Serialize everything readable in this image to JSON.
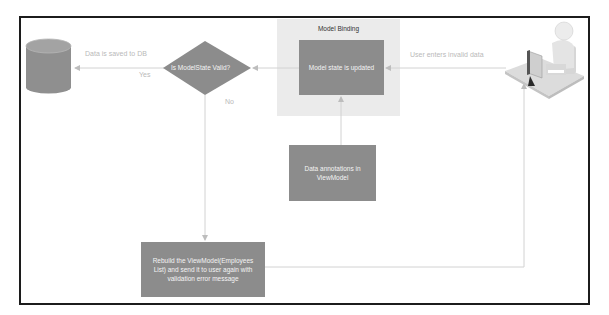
{
  "diagram": {
    "colors": {
      "frame_border": "#1c1c1c",
      "node_fill": "#8c8c8c",
      "node_text": "#f4f4f4",
      "group_fill": "#ebebeb",
      "connector": "#c8c8c8",
      "edge_label": "#b9b9b9"
    },
    "group": {
      "label": "Model Binding"
    },
    "nodes": {
      "database": {
        "shape": "cylinder",
        "icon": "database-icon"
      },
      "decision": {
        "shape": "diamond",
        "label": "Is ModelState Valid?"
      },
      "model_state": {
        "shape": "rectangle",
        "label": "Model state is updated"
      },
      "annotations": {
        "shape": "rectangle",
        "label": "Data annotations in ViewModel"
      },
      "rebuild": {
        "shape": "rectangle",
        "label": "Rebuild the ViewModel(Employees List) and send it to user again with validation error message"
      },
      "user": {
        "shape": "image",
        "icon": "user-at-computer-icon"
      }
    },
    "edges": {
      "user_to_model_state": {
        "label": "User enters invalid data"
      },
      "decision_to_db": {
        "label": "Data is saved to DB",
        "sub_label": "Yes"
      },
      "decision_to_rebuild": {
        "label": "No"
      },
      "annotations_to_model_state": {
        "label": ""
      },
      "model_state_to_decision": {
        "label": ""
      },
      "rebuild_to_user": {
        "label": ""
      }
    }
  }
}
